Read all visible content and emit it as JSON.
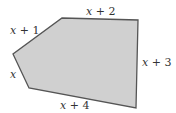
{
  "diagram": {
    "shape": "pentagon",
    "fill": "#d0d0d0",
    "stroke": "#555555",
    "vertices": [
      [
        62,
        18
      ],
      [
        138,
        20
      ],
      [
        136,
        108
      ],
      [
        29,
        88
      ],
      [
        13,
        54
      ]
    ],
    "sides": [
      {
        "label": "x + 2",
        "x": 86,
        "y": 15
      },
      {
        "label": "x + 3",
        "x": 142,
        "y": 66
      },
      {
        "label": "x + 4",
        "x": 60,
        "y": 109
      },
      {
        "label": "x",
        "x": 10,
        "y": 78
      },
      {
        "label": "x + 1",
        "x": 10,
        "y": 34
      }
    ]
  }
}
